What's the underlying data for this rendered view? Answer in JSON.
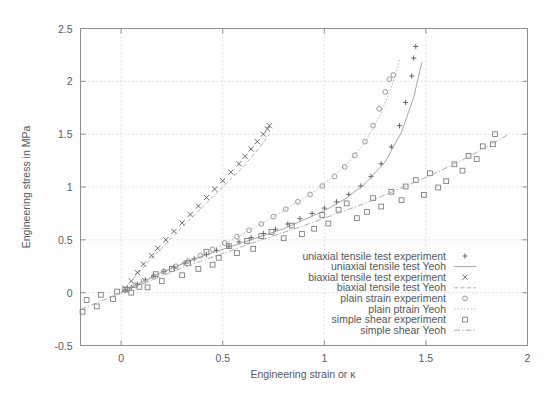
{
  "chart_data": {
    "type": "scatter",
    "title": "",
    "xlabel": "Engineering strain or κ",
    "ylabel": "Engineering stress in MPa",
    "xlim": [
      -0.2,
      2.0
    ],
    "ylim": [
      -0.5,
      2.5
    ],
    "xticks": [
      "0",
      "0.5",
      "1",
      "1.5",
      "2"
    ],
    "xtick_values": [
      0,
      0.5,
      1,
      1.5,
      2
    ],
    "yticks": [
      "-0.5",
      "0",
      "0.5",
      "1",
      "1.5",
      "2",
      "2.5"
    ],
    "ytick_values": [
      -0.5,
      0,
      0.5,
      1,
      1.5,
      2,
      2.5
    ],
    "grid": true,
    "legend_position": "inside lower right",
    "series": [
      {
        "name": "uniaxial tensile test experiment",
        "marker": "plus",
        "style": "points",
        "points": [
          [
            0.02,
            0.02
          ],
          [
            0.05,
            0.05
          ],
          [
            0.08,
            0.08
          ],
          [
            0.12,
            0.12
          ],
          [
            0.16,
            0.16
          ],
          [
            0.21,
            0.2
          ],
          [
            0.26,
            0.24
          ],
          [
            0.31,
            0.28
          ],
          [
            0.36,
            0.32
          ],
          [
            0.42,
            0.36
          ],
          [
            0.47,
            0.4
          ],
          [
            0.53,
            0.44
          ],
          [
            0.58,
            0.48
          ],
          [
            0.64,
            0.52
          ],
          [
            0.7,
            0.56
          ],
          [
            0.76,
            0.6
          ],
          [
            0.82,
            0.65
          ],
          [
            0.88,
            0.7
          ],
          [
            0.94,
            0.75
          ],
          [
            1.0,
            0.8
          ],
          [
            1.06,
            0.86
          ],
          [
            1.12,
            0.93
          ],
          [
            1.18,
            1.01
          ],
          [
            1.23,
            1.1
          ],
          [
            1.28,
            1.22
          ],
          [
            1.33,
            1.38
          ],
          [
            1.37,
            1.58
          ],
          [
            1.4,
            1.8
          ],
          [
            1.43,
            2.05
          ],
          [
            1.44,
            2.22
          ],
          [
            1.45,
            2.33
          ]
        ]
      },
      {
        "name": "uniaxial tensile test Yeoh",
        "marker": "none",
        "style": "line",
        "points": [
          [
            0.0,
            0.0
          ],
          [
            0.2,
            0.195
          ],
          [
            0.4,
            0.345
          ],
          [
            0.6,
            0.475
          ],
          [
            0.8,
            0.605
          ],
          [
            1.0,
            0.775
          ],
          [
            1.1,
            0.885
          ],
          [
            1.2,
            1.03
          ],
          [
            1.3,
            1.24
          ],
          [
            1.38,
            1.52
          ],
          [
            1.44,
            1.85
          ],
          [
            1.48,
            2.18
          ]
        ]
      },
      {
        "name": "biaxial tensile test experiment",
        "marker": "cross",
        "style": "points",
        "points": [
          [
            0.02,
            0.04
          ],
          [
            0.05,
            0.11
          ],
          [
            0.08,
            0.19
          ],
          [
            0.11,
            0.27
          ],
          [
            0.15,
            0.35
          ],
          [
            0.18,
            0.42
          ],
          [
            0.22,
            0.5
          ],
          [
            0.26,
            0.58
          ],
          [
            0.3,
            0.66
          ],
          [
            0.34,
            0.74
          ],
          [
            0.38,
            0.82
          ],
          [
            0.42,
            0.9
          ],
          [
            0.46,
            0.98
          ],
          [
            0.5,
            1.06
          ],
          [
            0.54,
            1.14
          ],
          [
            0.58,
            1.22
          ],
          [
            0.61,
            1.29
          ],
          [
            0.64,
            1.36
          ],
          [
            0.67,
            1.43
          ],
          [
            0.7,
            1.5
          ],
          [
            0.72,
            1.55
          ],
          [
            0.73,
            1.58
          ]
        ]
      },
      {
        "name": "biaxial tensile test Yeoh",
        "marker": "none",
        "style": "line",
        "points": [
          [
            0.0,
            0.0
          ],
          [
            0.1,
            0.22
          ],
          [
            0.2,
            0.42
          ],
          [
            0.3,
            0.62
          ],
          [
            0.4,
            0.81
          ],
          [
            0.5,
            1.0
          ],
          [
            0.6,
            1.19
          ],
          [
            0.68,
            1.37
          ],
          [
            0.73,
            1.5
          ]
        ]
      },
      {
        "name": "plain strain experiment",
        "marker": "circle",
        "style": "points",
        "points": [
          [
            0.03,
            0.03
          ],
          [
            0.07,
            0.07
          ],
          [
            0.11,
            0.11
          ],
          [
            0.16,
            0.15
          ],
          [
            0.21,
            0.2
          ],
          [
            0.27,
            0.25
          ],
          [
            0.33,
            0.3
          ],
          [
            0.39,
            0.35
          ],
          [
            0.45,
            0.41
          ],
          [
            0.51,
            0.47
          ],
          [
            0.57,
            0.53
          ],
          [
            0.63,
            0.59
          ],
          [
            0.69,
            0.65
          ],
          [
            0.75,
            0.72
          ],
          [
            0.81,
            0.79
          ],
          [
            0.87,
            0.86
          ],
          [
            0.93,
            0.93
          ],
          [
            0.99,
            1.01
          ],
          [
            1.05,
            1.1
          ],
          [
            1.1,
            1.19
          ],
          [
            1.15,
            1.3
          ],
          [
            1.2,
            1.43
          ],
          [
            1.24,
            1.58
          ],
          [
            1.27,
            1.74
          ],
          [
            1.3,
            1.9
          ],
          [
            1.32,
            2.02
          ],
          [
            1.34,
            2.06
          ]
        ]
      },
      {
        "name": "plain ptrain Yeoh",
        "marker": "none",
        "style": "line",
        "points": [
          [
            0.0,
            0.0
          ],
          [
            0.2,
            0.185
          ],
          [
            0.4,
            0.36
          ],
          [
            0.6,
            0.555
          ],
          [
            0.8,
            0.775
          ],
          [
            0.95,
            0.955
          ],
          [
            1.1,
            1.19
          ],
          [
            1.2,
            1.42
          ],
          [
            1.28,
            1.7
          ],
          [
            1.34,
            2.0
          ],
          [
            1.37,
            2.2
          ]
        ]
      },
      {
        "name": "simple shear experiment",
        "marker": "square",
        "style": "points",
        "points": [
          [
            -0.19,
            -0.18
          ],
          [
            -0.17,
            -0.07
          ],
          [
            -0.12,
            -0.13
          ],
          [
            -0.1,
            -0.02
          ],
          [
            -0.04,
            -0.06
          ],
          [
            -0.02,
            0.01
          ],
          [
            0.02,
            0.03
          ],
          [
            0.05,
            0.0
          ],
          [
            0.09,
            0.055
          ],
          [
            0.13,
            0.05
          ],
          [
            0.17,
            0.175
          ],
          [
            0.2,
            0.11
          ],
          [
            0.25,
            0.225
          ],
          [
            0.3,
            0.165
          ],
          [
            0.33,
            0.28
          ],
          [
            0.38,
            0.225
          ],
          [
            0.42,
            0.385
          ],
          [
            0.45,
            0.265
          ],
          [
            0.48,
            0.33
          ],
          [
            0.53,
            0.44
          ],
          [
            0.57,
            0.375
          ],
          [
            0.62,
            0.49
          ],
          [
            0.65,
            0.415
          ],
          [
            0.69,
            0.535
          ],
          [
            0.74,
            0.575
          ],
          [
            0.8,
            0.515
          ],
          [
            0.84,
            0.635
          ],
          [
            0.89,
            0.555
          ],
          [
            0.95,
            0.605
          ],
          [
            0.99,
            0.735
          ],
          [
            1.02,
            0.655
          ],
          [
            1.07,
            0.785
          ],
          [
            1.11,
            0.845
          ],
          [
            1.16,
            0.705
          ],
          [
            1.21,
            0.765
          ],
          [
            1.24,
            0.895
          ],
          [
            1.28,
            0.815
          ],
          [
            1.33,
            0.955
          ],
          [
            1.38,
            0.875
          ],
          [
            1.4,
            1.005
          ],
          [
            1.45,
            1.065
          ],
          [
            1.49,
            0.925
          ],
          [
            1.52,
            1.13
          ],
          [
            1.56,
            0.995
          ],
          [
            1.6,
            1.055
          ],
          [
            1.64,
            1.215
          ],
          [
            1.68,
            1.155
          ],
          [
            1.71,
            1.295
          ],
          [
            1.75,
            1.265
          ],
          [
            1.78,
            1.385
          ],
          [
            1.83,
            1.405
          ],
          [
            1.84,
            1.5
          ]
        ]
      },
      {
        "name": "simple shear Yeoh",
        "marker": "none",
        "style": "line",
        "points": [
          [
            -0.2,
            -0.16
          ],
          [
            0.0,
            0.0
          ],
          [
            0.3,
            0.235
          ],
          [
            0.6,
            0.44
          ],
          [
            0.9,
            0.635
          ],
          [
            1.2,
            0.845
          ],
          [
            1.5,
            1.09
          ],
          [
            1.7,
            1.275
          ],
          [
            1.9,
            1.49
          ]
        ]
      }
    ],
    "legend": [
      {
        "label": "uniaxial tensile test experiment",
        "marker": "plus"
      },
      {
        "label": "uniaxial tensile test Yeoh",
        "marker": "line"
      },
      {
        "label": "biaxial tensile test experiment",
        "marker": "cross"
      },
      {
        "label": "biaxial tensile test Yeoh",
        "marker": "line"
      },
      {
        "label": "plain strain experiment",
        "marker": "circle"
      },
      {
        "label": "plain ptrain Yeoh",
        "marker": "line"
      },
      {
        "label": "simple shear experiment",
        "marker": "square"
      },
      {
        "label": "simple shear Yeoh",
        "marker": "line"
      }
    ],
    "colors": {
      "frame": "#8e9194",
      "grid": "#c8cbce",
      "text": "#55595c",
      "marker": "#4e5255",
      "line": "#9a9da0",
      "background": "#fdfdfd"
    }
  }
}
